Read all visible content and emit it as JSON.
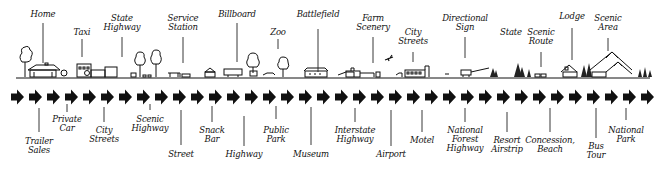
{
  "diagram": {
    "type": "roadside-sequence",
    "flow_direction": "left-to-right",
    "arrow_count": 36,
    "colors": {
      "ink": "#111111",
      "background": "#ffffff"
    }
  },
  "top_labels": [
    {
      "text": "Home",
      "x": 43,
      "y": 10,
      "lead_top": 23,
      "lead_bottom": 63
    },
    {
      "text": "Taxi",
      "x": 82,
      "y": 28,
      "lead_top": 39,
      "lead_bottom": 57
    },
    {
      "text": "State\nHighway",
      "x": 122,
      "y": 14,
      "lead_top": 37,
      "lead_bottom": 57
    },
    {
      "text": "Service\nStation",
      "x": 183,
      "y": 14,
      "lead_top": 37,
      "lead_bottom": 63
    },
    {
      "text": "Billboard",
      "x": 237,
      "y": 10,
      "lead_top": 23,
      "lead_bottom": 62
    },
    {
      "text": "Zoo",
      "x": 278,
      "y": 28,
      "lead_top": 39,
      "lead_bottom": 49
    },
    {
      "text": "Battlefield",
      "x": 318,
      "y": 10,
      "lead_top": 29,
      "lead_bottom": 72
    },
    {
      "text": "Farm\nScenery",
      "x": 373,
      "y": 14,
      "lead_top": 37,
      "lead_bottom": 63
    },
    {
      "text": "City\nStreets",
      "x": 413,
      "y": 28,
      "lead_top": 52,
      "lead_bottom": 62
    },
    {
      "text": "Directional\nSign",
      "x": 465,
      "y": 14,
      "lead_top": 37,
      "lead_bottom": 58
    },
    {
      "text": "State",
      "x": 511,
      "y": 28,
      "lead_top": 0,
      "lead_bottom": 0
    },
    {
      "text": "Scenic\nRoute",
      "x": 541,
      "y": 28,
      "lead_top": 52,
      "lead_bottom": 67
    },
    {
      "text": "Lodge",
      "x": 572,
      "y": 12,
      "lead_top": 28,
      "lead_bottom": 60
    },
    {
      "text": "Scenic\nArea",
      "x": 608,
      "y": 14,
      "lead_top": 38,
      "lead_bottom": 51
    }
  ],
  "bottom_labels": [
    {
      "text": "Trailer\nSales",
      "x": 39,
      "y": 137,
      "lead_top": 108,
      "lead_bottom": 132
    },
    {
      "text": "Private\nCar",
      "x": 67,
      "y": 115,
      "lead_top": 104,
      "lead_bottom": 112
    },
    {
      "text": "City\nStreets",
      "x": 104,
      "y": 126,
      "lead_top": 107,
      "lead_bottom": 122
    },
    {
      "text": "Scenic\nHighway",
      "x": 150,
      "y": 115,
      "lead_top": 104,
      "lead_bottom": 110
    },
    {
      "text": "Street",
      "x": 181,
      "y": 150,
      "lead_top": 110,
      "lead_bottom": 145
    },
    {
      "text": "Snack\nBar",
      "x": 212,
      "y": 126,
      "lead_top": 106,
      "lead_bottom": 122
    },
    {
      "text": "Highway",
      "x": 244,
      "y": 150,
      "lead_top": 116,
      "lead_bottom": 146
    },
    {
      "text": "Public\nPark",
      "x": 276,
      "y": 126,
      "lead_top": 106,
      "lead_bottom": 119
    },
    {
      "text": "Museum",
      "x": 311,
      "y": 150,
      "lead_top": 107,
      "lead_bottom": 145
    },
    {
      "text": "Interstate\nHighway",
      "x": 355,
      "y": 126,
      "lead_top": 108,
      "lead_bottom": 122
    },
    {
      "text": "Airport",
      "x": 391,
      "y": 150,
      "lead_top": 110,
      "lead_bottom": 146
    },
    {
      "text": "Motel",
      "x": 422,
      "y": 136,
      "lead_top": 110,
      "lead_bottom": 132
    },
    {
      "text": "National\nForest\nHighway",
      "x": 465,
      "y": 126,
      "lead_top": 108,
      "lead_bottom": 122
    },
    {
      "text": "Resort\nAirstrip",
      "x": 507,
      "y": 136,
      "lead_top": 112,
      "lead_bottom": 132
    },
    {
      "text": "Concession,\nBeach",
      "x": 550,
      "y": 136,
      "lead_top": 108,
      "lead_bottom": 132
    },
    {
      "text": "Bus\nTour",
      "x": 596,
      "y": 142,
      "lead_top": 108,
      "lead_bottom": 138
    },
    {
      "text": "National\nPark",
      "x": 626,
      "y": 126,
      "lead_top": 108,
      "lead_bottom": 120
    }
  ],
  "ground_line": {
    "y": 77,
    "x_start": 14,
    "x_end": 654
  }
}
